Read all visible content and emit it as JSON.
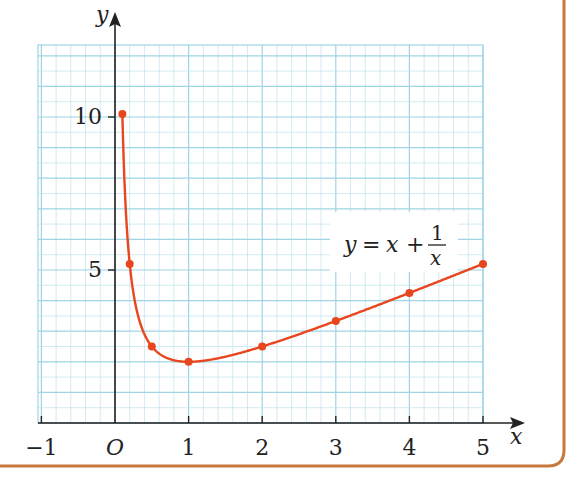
{
  "chart_data": {
    "type": "line",
    "title": "",
    "function_label": {
      "lhs": "y",
      "eq": "=",
      "x": "x",
      "plus": "+",
      "num": "1",
      "den": "x"
    },
    "xlabel": "x",
    "ylabel": "y",
    "origin_label": "O",
    "x_ticks": [
      {
        "value": -1,
        "label": "−1"
      },
      {
        "value": 1,
        "label": "1"
      },
      {
        "value": 2,
        "label": "2"
      },
      {
        "value": 3,
        "label": "3"
      },
      {
        "value": 4,
        "label": "4"
      },
      {
        "value": 5,
        "label": "5"
      }
    ],
    "y_ticks": [
      {
        "value": 5,
        "label": "5"
      },
      {
        "value": 10,
        "label": "10"
      }
    ],
    "xlim": [
      -1,
      5
    ],
    "ylim": [
      0,
      12.4
    ],
    "grid": true,
    "series": [
      {
        "name": "y = x + 1/x",
        "x": [
          0.1,
          0.2,
          0.5,
          1,
          2,
          3,
          4,
          5
        ],
        "values": [
          10.1,
          5.2,
          2.5,
          2,
          2.5,
          3.33,
          4.25,
          5.2
        ]
      }
    ],
    "colors": {
      "curve": "#e8461e",
      "grid": "#bfe3ee",
      "grid_major": "#9fd4e4",
      "axis": "#222222",
      "border": "#c8793a"
    }
  }
}
